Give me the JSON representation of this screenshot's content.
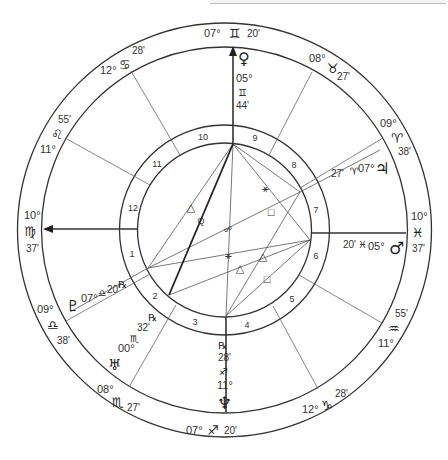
{
  "chart": {
    "type": "natal-wheel",
    "center": [
      224.5,
      230
    ],
    "radii": {
      "outer": 207,
      "zodiac_inner": 183,
      "house_outer": 105,
      "house_inner": 87
    }
  },
  "cusps": [
    {
      "id": "mc",
      "deg": "07°",
      "sign": "♊",
      "sign_name": "gemini",
      "min": "20'"
    },
    {
      "id": "c11",
      "deg": "08°",
      "sign": "♉",
      "sign_name": "taurus",
      "min": "27'"
    },
    {
      "id": "c12",
      "deg": "09°",
      "sign": "♈",
      "sign_name": "aries",
      "min": "38'"
    },
    {
      "id": "dsc",
      "deg": "10°",
      "sign": "♓",
      "sign_name": "pisces",
      "min": "37'"
    },
    {
      "id": "c5",
      "deg": "11°",
      "sign": "♒",
      "sign_name": "aquarius",
      "min": "55'"
    },
    {
      "id": "c6",
      "deg": "12°",
      "sign": "♑",
      "sign_name": "capricorn",
      "min": "28'"
    },
    {
      "id": "ic",
      "deg": "07°",
      "sign": "♐",
      "sign_name": "sagittarius",
      "min": "20'"
    },
    {
      "id": "c2",
      "deg": "08°",
      "sign": "♏",
      "sign_name": "scorpio",
      "min": "27'"
    },
    {
      "id": "c3",
      "deg": "09°",
      "sign": "♎",
      "sign_name": "libra",
      "min": "38'"
    },
    {
      "id": "asc",
      "deg": "10°",
      "sign": "♍",
      "sign_name": "virgo",
      "min": "37'"
    },
    {
      "id": "c11b",
      "deg": "11°",
      "sign": "♌",
      "sign_name": "leo",
      "min": "55'"
    },
    {
      "id": "c12b",
      "deg": "12°",
      "sign": "♋",
      "sign_name": "cancer",
      "min": "28'"
    }
  ],
  "houses": [
    "1",
    "2",
    "3",
    "4",
    "5",
    "6",
    "7",
    "8",
    "9",
    "10",
    "11",
    "12"
  ],
  "planets": [
    {
      "name": "venus",
      "glyph": "♀",
      "deg": "05°",
      "sign": "♊",
      "min": "44'",
      "retro": ""
    },
    {
      "name": "jupiter",
      "glyph": "♃",
      "deg": "07°",
      "sign": "♈",
      "min": "27'",
      "retro": ""
    },
    {
      "name": "mars",
      "glyph": "♂",
      "deg": "05°",
      "sign": "♓",
      "min": "20'",
      "retro": ""
    },
    {
      "name": "neptune",
      "glyph": "♆",
      "deg": "11°",
      "sign": "♐",
      "min": "28'",
      "retro": "℞"
    },
    {
      "name": "uranus",
      "glyph": "♅",
      "deg": "00°",
      "sign": "♏",
      "min": "32'",
      "retro": "℞"
    },
    {
      "name": "pluto",
      "glyph": "♇",
      "deg": "07°",
      "sign": "♎",
      "min": "20'",
      "retro": "℞"
    }
  ],
  "aspects": {
    "symbols": [
      {
        "name": "sextile",
        "glyph": "⚹"
      },
      {
        "name": "square",
        "glyph": "□"
      },
      {
        "name": "trine",
        "glyph": "△"
      },
      {
        "name": "quintile",
        "glyph": "Q"
      },
      {
        "name": "opposition",
        "glyph": "☍"
      },
      {
        "name": "sextile",
        "glyph": "⚹"
      },
      {
        "name": "trine",
        "glyph": "△"
      },
      {
        "name": "trine",
        "glyph": "△"
      },
      {
        "name": "square",
        "glyph": "□"
      }
    ]
  },
  "colors": {
    "line": "#333333",
    "thin": "#555555",
    "bg": "#ffffff"
  }
}
